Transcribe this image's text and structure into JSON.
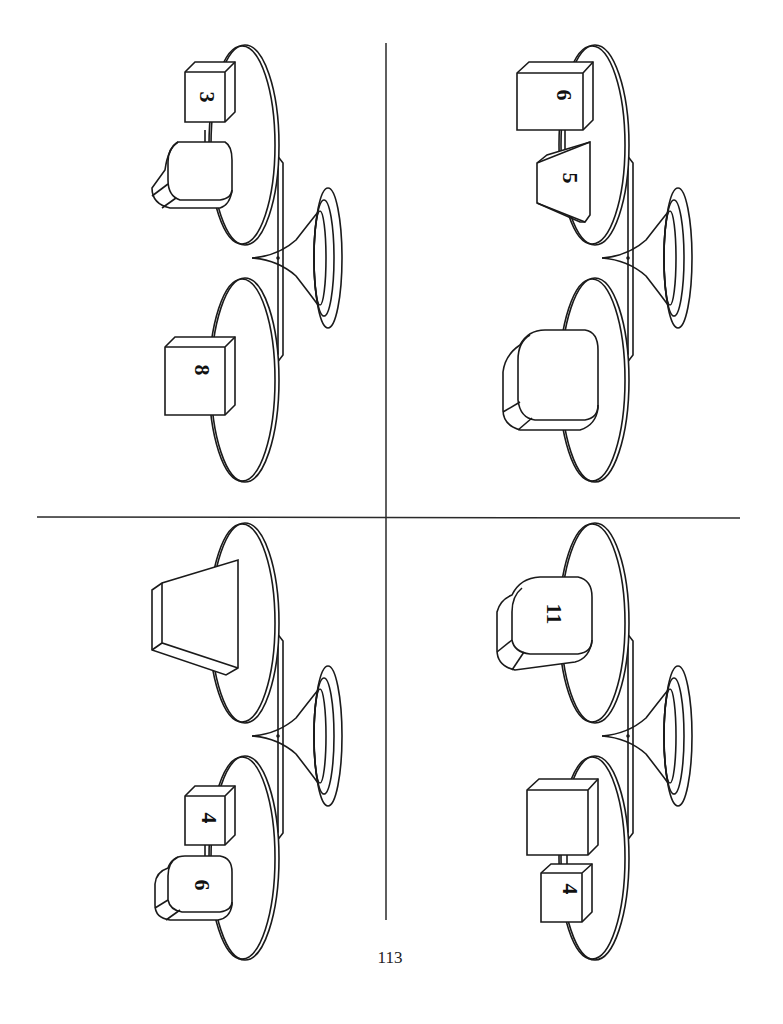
{
  "page": {
    "number": "113",
    "orientation": "rotated-90-clockwise"
  },
  "colors": {
    "ink": "#1a1a1a",
    "background": "#ffffff"
  },
  "puzzles": [
    {
      "id": "top-left",
      "left_pan": {
        "items": [
          {
            "shape": "cube",
            "label": "8"
          }
        ]
      },
      "right_pan": {
        "items": [
          {
            "shape": "cube",
            "label": "3"
          },
          {
            "shape": "rounded-block",
            "label": ""
          }
        ]
      }
    },
    {
      "id": "top-right",
      "left_pan": {
        "items": [
          {
            "shape": "rounded-block",
            "label": ""
          }
        ]
      },
      "right_pan": {
        "items": [
          {
            "shape": "cube",
            "label": "6"
          },
          {
            "shape": "trapezoid-block",
            "label": "5"
          }
        ]
      }
    },
    {
      "id": "bottom-left",
      "left_pan": {
        "items": [
          {
            "shape": "cube",
            "label": "4"
          },
          {
            "shape": "rounded-block",
            "label": "6"
          }
        ]
      },
      "right_pan": {
        "items": [
          {
            "shape": "trapezoid-block",
            "label": ""
          }
        ]
      }
    },
    {
      "id": "bottom-right",
      "left_pan": {
        "items": [
          {
            "shape": "cube",
            "label": ""
          },
          {
            "shape": "cube",
            "label": "4"
          }
        ]
      },
      "right_pan": {
        "items": [
          {
            "shape": "rounded-block",
            "label": "11"
          }
        ]
      }
    }
  ],
  "labels": {
    "tl_cube_top": "3",
    "tl_cube_bottom": "8",
    "tr_cube_top": "6",
    "tr_trap_top": "5",
    "bl_cube_bottom": "4",
    "bl_round_bottom": "6",
    "br_round_top": "11",
    "br_cube_bottom_small": "4"
  }
}
